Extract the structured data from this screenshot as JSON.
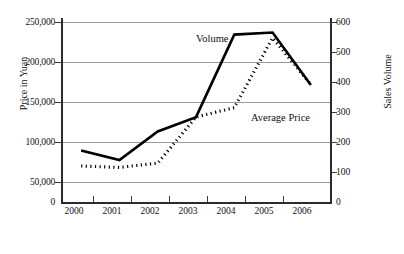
{
  "chart_data": {
    "type": "line",
    "title": "",
    "xlabel": "",
    "ylabel": "Price in Yuan",
    "y2label": "Sales Volume",
    "grid": true,
    "legend_position": "inline-annotation",
    "categories": [
      "2000",
      "2001",
      "2002",
      "2003",
      "2004",
      "2005",
      "2006"
    ],
    "x": [
      2000,
      2001,
      2002,
      2003,
      2004,
      2005,
      2006
    ],
    "yticks_left": [
      "0",
      "50,000",
      "100,000",
      "150,000",
      "200,000",
      "250,000"
    ],
    "yticks_left_values": [
      0,
      50000,
      100000,
      150000,
      200000,
      250000
    ],
    "ylim": [
      0,
      250000
    ],
    "yticks_right": [
      "0",
      "100",
      "200",
      "300",
      "400",
      "500",
      "600"
    ],
    "yticks_right_values": [
      0,
      100,
      200,
      300,
      400,
      500,
      600
    ],
    "y2lim": [
      0,
      600
    ],
    "series": [
      {
        "name": "Volume",
        "axis": "right",
        "style": "solid",
        "color": "#000000",
        "values": [
          172,
          140,
          235,
          283,
          558,
          565,
          390
        ]
      },
      {
        "name": "Average Price",
        "axis": "left",
        "style": "dotted",
        "color": "#000000",
        "values": [
          50000,
          48000,
          54000,
          118000,
          131000,
          228000,
          163000
        ]
      }
    ],
    "annotations": [
      {
        "text": "Volume",
        "series": "Volume"
      },
      {
        "text": "Average Price",
        "series": "Average Price"
      }
    ]
  },
  "colors": {
    "line": "#000000",
    "grid": "#9a9a9a",
    "axis": "#2b2b2b",
    "background": "#ffffff",
    "text": "#111111"
  }
}
